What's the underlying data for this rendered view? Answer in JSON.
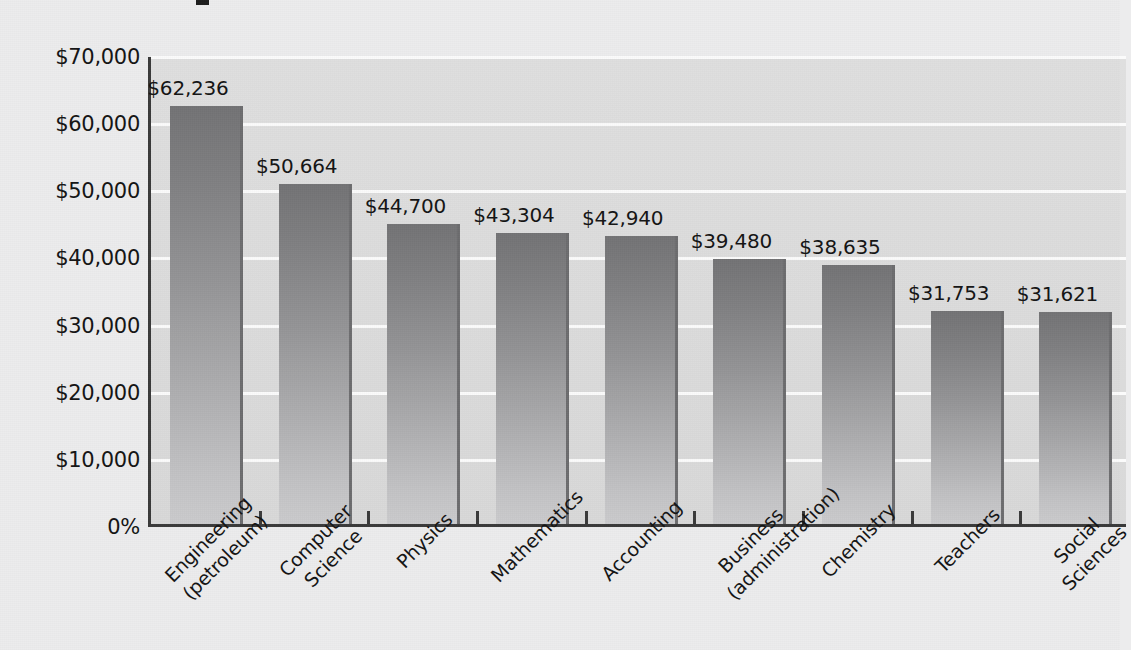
{
  "page": {
    "background_color": "#ececed",
    "title_fragment_visible": true
  },
  "chart_data": {
    "type": "bar",
    "title": "",
    "xlabel": "",
    "ylabel": "",
    "ylim": [
      0,
      70000
    ],
    "grid": true,
    "legend": "none",
    "orientation": "vertical",
    "bar_color_top": "#737375",
    "bar_color_bottom": "#cbcbcd",
    "plot_background": "#dcdcdc",
    "gridline_color": "#fbfbfb",
    "axis_color": "#3a3a3a",
    "categories": [
      "Engineering (petroleum)",
      "Computer Science",
      "Physics",
      "Mathematics",
      "Accounting",
      "Business (administration)",
      "Chemistry",
      "Teachers",
      "Social Sciences"
    ],
    "category_lines": [
      [
        "Engineering",
        "(petroleum)"
      ],
      [
        "Computer",
        "Science"
      ],
      [
        "Physics"
      ],
      [
        "Mathematics"
      ],
      [
        "Accounting"
      ],
      [
        "Business",
        "(administration)"
      ],
      [
        "Chemistry"
      ],
      [
        "Teachers"
      ],
      [
        "Social",
        "Sciences"
      ]
    ],
    "values": [
      62236,
      50664,
      44700,
      43304,
      42940,
      39480,
      38635,
      31753,
      31621
    ],
    "value_labels": [
      "$62,236",
      "$50,664",
      "$44,700",
      "$43,304",
      "$42,940",
      "$39,480",
      "$38,635",
      "$31,753",
      "$31,621"
    ],
    "yticks": [
      70000,
      60000,
      50000,
      40000,
      30000,
      20000,
      10000,
      0
    ],
    "ytick_labels": [
      "$70,000",
      "$60,000",
      "$50,000",
      "$40,000",
      "$30,000",
      "$20,000",
      "$10,000",
      "0%"
    ]
  }
}
